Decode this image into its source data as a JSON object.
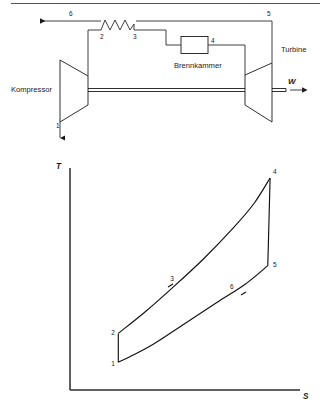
{
  "figure": {
    "title_rule": true,
    "schematic": {
      "components": [
        {
          "id": "kompressor",
          "label": "Kompressor"
        },
        {
          "id": "brennkammer",
          "label": "Brennkammer"
        },
        {
          "id": "turbine",
          "label": "Turbine"
        }
      ],
      "work_label": "W",
      "state_points": [
        {
          "id": "1",
          "label": "1"
        },
        {
          "id": "2",
          "label": "2"
        },
        {
          "id": "3",
          "label": "3"
        },
        {
          "id": "4",
          "label": "4"
        },
        {
          "id": "5",
          "label": "5"
        },
        {
          "id": "6",
          "label": "6"
        }
      ]
    }
  },
  "chart_data": {
    "type": "line",
    "title": "",
    "xlabel": "S",
    "ylabel": "T",
    "grid": false,
    "legend": "none",
    "axis_label_x": "S",
    "axis_label_y": "T",
    "xlim": [
      0,
      10
    ],
    "ylim": [
      0,
      10
    ],
    "annotations": [
      {
        "label": "1",
        "x": 2.1,
        "y": 1.25
      },
      {
        "label": "2",
        "x": 2.1,
        "y": 2.55
      },
      {
        "label": "3",
        "x": 4.45,
        "y": 4.75
      },
      {
        "label": "4",
        "x": 8.7,
        "y": 9.6
      },
      {
        "label": "5",
        "x": 8.65,
        "y": 5.65
      },
      {
        "label": "6",
        "x": 7.0,
        "y": 4.35
      }
    ],
    "series": [
      {
        "name": "1-2 compression",
        "points": [
          {
            "x": 2.1,
            "y": 1.25
          },
          {
            "x": 2.1,
            "y": 2.55
          }
        ]
      },
      {
        "name": "2-3-4 heat addition",
        "points": [
          {
            "x": 2.1,
            "y": 2.55
          },
          {
            "x": 3.3,
            "y": 3.55
          },
          {
            "x": 4.45,
            "y": 4.6
          },
          {
            "x": 5.8,
            "y": 5.9
          },
          {
            "x": 7.1,
            "y": 7.3
          },
          {
            "x": 8.0,
            "y": 8.4
          },
          {
            "x": 8.7,
            "y": 9.55
          }
        ]
      },
      {
        "name": "4-5 expansion",
        "points": [
          {
            "x": 8.7,
            "y": 9.55
          },
          {
            "x": 8.6,
            "y": 5.6
          }
        ]
      },
      {
        "name": "5-6-1 heat rejection",
        "points": [
          {
            "x": 8.6,
            "y": 5.6
          },
          {
            "x": 7.6,
            "y": 4.75
          },
          {
            "x": 6.4,
            "y": 3.95
          },
          {
            "x": 5.0,
            "y": 3.0
          },
          {
            "x": 3.6,
            "y": 2.05
          },
          {
            "x": 2.6,
            "y": 1.5
          },
          {
            "x": 2.1,
            "y": 1.25
          }
        ]
      }
    ]
  }
}
